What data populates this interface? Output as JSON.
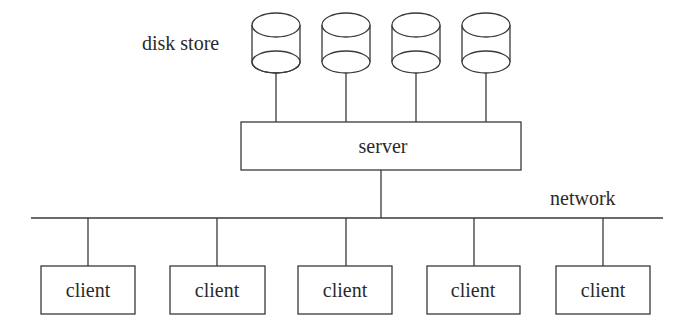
{
  "diagram": {
    "type": "client-server network topology",
    "labels": {
      "disk_store": "disk store",
      "server": "server",
      "network": "network"
    },
    "disks": [
      {
        "id": "disk-1",
        "cx": 276
      },
      {
        "id": "disk-2",
        "cx": 346
      },
      {
        "id": "disk-3",
        "cx": 416
      },
      {
        "id": "disk-4",
        "cx": 486
      }
    ],
    "server": {
      "label": "server",
      "x": 241,
      "y": 122,
      "w": 280,
      "h": 48
    },
    "network": {
      "label": "network",
      "x1": 31,
      "x2": 663,
      "y": 218
    },
    "clients": [
      {
        "label": "client",
        "x": 41,
        "cx": 88
      },
      {
        "label": "client",
        "x": 170,
        "cx": 217
      },
      {
        "label": "client",
        "x": 298,
        "cx": 346
      },
      {
        "label": "client",
        "x": 427,
        "cx": 474
      },
      {
        "label": "client",
        "x": 556,
        "cx": 603
      }
    ],
    "colors": {
      "line": "#3a3a3a",
      "text": "#2a2a2a",
      "background": "#ffffff"
    }
  }
}
